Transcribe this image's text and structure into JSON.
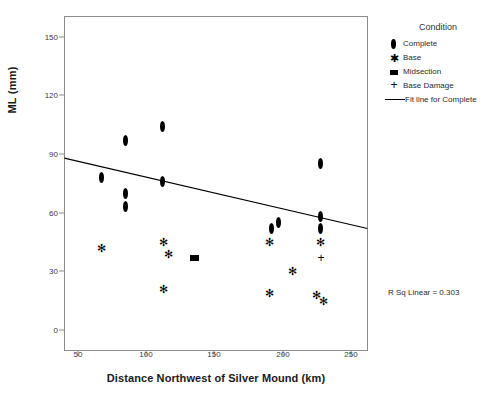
{
  "chart_data": {
    "type": "scatter",
    "title": "",
    "xlabel": "Distance Northwest of Silver Mound (km)",
    "ylabel": "ML (mm)",
    "xlim": [
      40,
      262
    ],
    "ylim": [
      -8,
      160
    ],
    "xticks": [
      50,
      100,
      150,
      200,
      250
    ],
    "yticks": [
      0,
      30,
      60,
      90,
      120,
      150
    ],
    "grid": false,
    "legend_position": "right",
    "legend_title": "Condition",
    "annotations": [
      {
        "text": "R Sq Linear = 0.303",
        "x": 0.93,
        "y": 0.17
      }
    ],
    "series": [
      {
        "name": "Complete",
        "marker": "diamond",
        "points": [
          {
            "x": 67,
            "y": 78
          },
          {
            "x": 85,
            "y": 97
          },
          {
            "x": 85,
            "y": 70
          },
          {
            "x": 85,
            "y": 63
          },
          {
            "x": 112,
            "y": 104
          },
          {
            "x": 112,
            "y": 76
          },
          {
            "x": 192,
            "y": 52
          },
          {
            "x": 197,
            "y": 55
          },
          {
            "x": 228,
            "y": 85
          },
          {
            "x": 228,
            "y": 58
          },
          {
            "x": 228,
            "y": 52
          }
        ]
      },
      {
        "name": "Base",
        "marker": "star",
        "points": [
          {
            "x": 67,
            "y": 42
          },
          {
            "x": 113,
            "y": 45
          },
          {
            "x": 116,
            "y": 39
          },
          {
            "x": 113,
            "y": 21
          },
          {
            "x": 190,
            "y": 45
          },
          {
            "x": 190,
            "y": 19
          },
          {
            "x": 207,
            "y": 30
          },
          {
            "x": 225,
            "y": 18
          },
          {
            "x": 230,
            "y": 15
          },
          {
            "x": 228,
            "y": 45
          }
        ]
      },
      {
        "name": "Midsection",
        "marker": "square",
        "points": [
          {
            "x": 135,
            "y": 37
          }
        ]
      },
      {
        "name": "Base Damage",
        "marker": "plus",
        "points": [
          {
            "x": 228,
            "y": 37
          }
        ]
      }
    ],
    "fit_line": {
      "name": "Fit line for Complete",
      "x_start": 40,
      "y_start": 88,
      "x_end": 262,
      "y_end": 52,
      "r_squared": 0.303
    }
  },
  "axes": {
    "y_title": "ML (mm)",
    "x_title": "Distance Northwest of Silver Mound (km)",
    "y_tick_labels": [
      "150",
      "120",
      "90",
      "60",
      "30",
      "0"
    ],
    "x_tick_labels": [
      "50",
      "100",
      "150",
      "200",
      "250"
    ]
  },
  "legend": {
    "title": "Condition",
    "entries": [
      {
        "label": "Complete",
        "icon": "diamond-marker-icon"
      },
      {
        "label": "Base",
        "icon": "star-marker-icon"
      },
      {
        "label": "Midsection",
        "icon": "square-marker-icon"
      },
      {
        "label": "Base Damage",
        "icon": "plus-marker-icon"
      },
      {
        "label": "Fit line for Complete",
        "icon": "line-marker-icon"
      }
    ]
  },
  "annotation": {
    "rsq": "R Sq Linear = 0.303"
  },
  "colors": {
    "marker": "#000000",
    "axis": "#808080",
    "fit_line": "#000000",
    "background": "#ffffff"
  }
}
